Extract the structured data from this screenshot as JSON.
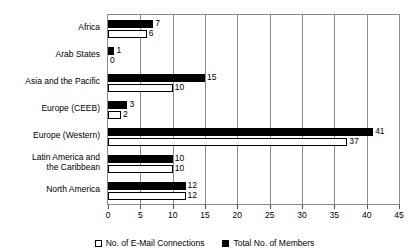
{
  "chart_data": {
    "type": "bar",
    "orientation": "horizontal",
    "title": "",
    "xlabel": "",
    "ylabel": "",
    "xlim": [
      0,
      45
    ],
    "xticks": [
      0,
      5,
      10,
      15,
      20,
      25,
      30,
      35,
      40,
      45
    ],
    "grid": true,
    "legend_position": "bottom",
    "categories": [
      "Africa",
      "Arab States",
      "Asia and the Pacific",
      "Europe (CEEB)",
      "Europe (Western)",
      "Latin America and\nthe Caribbean",
      "North America"
    ],
    "series": [
      {
        "name": "Total No. of Members",
        "color": "#000000",
        "fill": "solid",
        "values": [
          7,
          1,
          15,
          3,
          41,
          10,
          12
        ]
      },
      {
        "name": "No. of E-Mail Connections",
        "color": "#ffffff",
        "fill": "hollow",
        "values": [
          6,
          0,
          10,
          2,
          37,
          10,
          12
        ]
      }
    ],
    "data_labels": {
      "Africa": {
        "members": "7",
        "email": "6"
      },
      "Arab States": {
        "members": "1",
        "email": "0"
      },
      "Asia and the Pacific": {
        "members": "15",
        "email": "10"
      },
      "Europe (CEEB)": {
        "members": "3",
        "email": "2"
      },
      "Europe (Western)": {
        "members": "41",
        "email": "37"
      },
      "Latin America and the Caribbean": {
        "members": "10",
        "email": "10"
      },
      "North America": {
        "members": "12",
        "email": "12"
      }
    }
  },
  "legend": {
    "items": [
      {
        "label": "No. of E-Mail Connections",
        "style": "email"
      },
      {
        "label": "Total No. of Members",
        "style": "members"
      }
    ]
  },
  "axis": {
    "tick_labels": [
      "0",
      "5",
      "10",
      "15",
      "20",
      "25",
      "30",
      "35",
      "40",
      "45"
    ]
  },
  "colors": {
    "series_members": "#000000",
    "series_email": "#ffffff",
    "grid": "#8a8a8a",
    "text": "#000000",
    "background": "#ffffff"
  }
}
